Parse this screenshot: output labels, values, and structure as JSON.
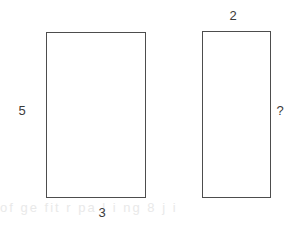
{
  "figure": {
    "type": "geometry-diagram",
    "background_color": "#ffffff",
    "stroke_color": "#4d4d4d",
    "text_color": "#3b3b3b",
    "watermark_text": "of ge fit r pa  l i ng  8    j i"
  },
  "shapes": {
    "left_rectangle": {
      "name": "left-rectangle",
      "width_label": "3",
      "height_label": "5"
    },
    "right_rectangle": {
      "name": "right-rectangle",
      "width_label": "2",
      "height_label": "?"
    }
  },
  "labels": {
    "left_height": "5",
    "left_width": "3",
    "right_width": "2",
    "right_height": "?"
  }
}
